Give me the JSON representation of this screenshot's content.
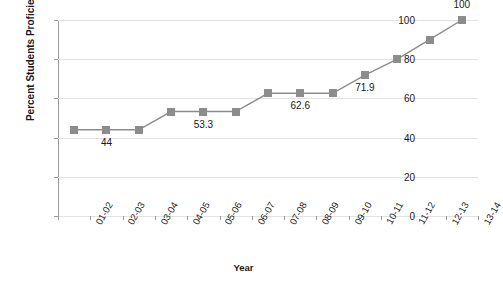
{
  "chart_data": {
    "type": "line",
    "title": "",
    "xlabel": "Year",
    "ylabel": "Percent Students Proficient",
    "categories": [
      "01-02",
      "02-03",
      "03-04",
      "04-05",
      "05-06",
      "06-07",
      "07-08",
      "08-09",
      "09-10",
      "10-11",
      "11-12",
      "12-13",
      "13-14"
    ],
    "values": [
      44,
      44,
      44,
      53.3,
      53.3,
      53.3,
      62.6,
      62.6,
      62.6,
      71.9,
      80,
      90,
      100
    ],
    "point_labels": [
      {
        "index": 1,
        "text": "44",
        "position": "below"
      },
      {
        "index": 4,
        "text": "53.3",
        "position": "below"
      },
      {
        "index": 7,
        "text": "62.6",
        "position": "below"
      },
      {
        "index": 9,
        "text": "71.9",
        "position": "below"
      },
      {
        "index": 12,
        "text": "100",
        "position": "above"
      }
    ],
    "ylim": [
      0,
      100
    ],
    "ytick_labels": [
      "0",
      "20",
      "40",
      "60",
      "80",
      "100"
    ],
    "ytick_values": [
      0,
      20,
      40,
      60,
      80,
      100
    ],
    "grid": true,
    "legend": "none",
    "series_color": "#8c8c8c",
    "grid_color": "#e2e2e2",
    "axis_color": "#9a9a9a",
    "text_color": "#1a1a1a"
  }
}
